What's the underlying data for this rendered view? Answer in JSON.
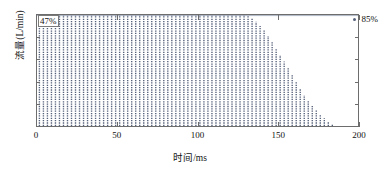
{
  "chart_data": {
    "type": "bar",
    "title": "",
    "xlabel": "时间/ms",
    "ylabel": "流量(L/min)",
    "xlim": [
      0,
      200
    ],
    "ylim": [
      0,
      1.0
    ],
    "xticks": [
      0,
      50,
      100,
      150,
      200
    ],
    "xtick_labels": [
      "0",
      "50",
      "100",
      "150",
      "200"
    ],
    "yticks": [
      0.2,
      0.4,
      0.6,
      0.8,
      1.0
    ],
    "ytick_labels": [
      "0.2",
      "0.4",
      "0.6",
      "0.8",
      "1.0"
    ],
    "grid": false,
    "legend": false,
    "line_color": "#55607a",
    "frame_color": "#6d6d6d",
    "annotations": [
      {
        "name": "duty-cycle-start",
        "text": "47%",
        "position": "top-left",
        "boxed": true
      },
      {
        "name": "duty-cycle-end",
        "text": "85%",
        "position": "top-right",
        "boxed": false,
        "marker": "arrow"
      }
    ],
    "envelope_note": "Upper envelope line drawn at y = 1.0 across the full time axis.",
    "x": [
      1.5,
      4.0,
      6.5,
      9.0,
      11.5,
      14.0,
      16.5,
      19.0,
      21.5,
      24.0,
      26.5,
      29.0,
      31.5,
      34.0,
      36.5,
      39.0,
      41.5,
      44.0,
      46.5,
      49.0,
      51.5,
      54.0,
      56.5,
      59.0,
      61.5,
      64.0,
      66.5,
      69.0,
      71.5,
      74.0,
      76.5,
      79.0,
      81.5,
      84.0,
      86.5,
      89.0,
      91.5,
      94.0,
      96.5,
      99.0,
      101.5,
      104.0,
      106.5,
      109.0,
      111.5,
      114.0,
      116.5,
      119.0,
      121.5,
      124.0,
      126.5,
      129.0,
      131.5,
      134.0,
      136.5,
      139.0,
      141.5,
      144.0,
      146.5,
      149.0,
      151.5,
      154.0,
      156.5,
      159.0,
      161.5,
      164.0,
      166.5,
      169.0,
      171.5,
      174.0,
      176.5,
      179.0,
      181.5,
      184.0
    ],
    "values": [
      1.0,
      1.0,
      1.0,
      1.0,
      1.0,
      1.0,
      1.0,
      1.0,
      1.0,
      1.0,
      1.0,
      1.0,
      1.0,
      1.0,
      1.0,
      1.0,
      1.0,
      1.0,
      1.0,
      1.0,
      1.0,
      1.0,
      1.0,
      1.0,
      1.0,
      1.0,
      1.0,
      1.0,
      1.0,
      1.0,
      1.0,
      1.0,
      1.0,
      1.0,
      1.0,
      1.0,
      1.0,
      1.0,
      1.0,
      1.0,
      1.0,
      1.0,
      1.0,
      1.0,
      1.0,
      1.0,
      1.0,
      1.0,
      1.0,
      1.0,
      1.0,
      1.0,
      0.99,
      0.97,
      0.94,
      0.9,
      0.86,
      0.81,
      0.76,
      0.7,
      0.64,
      0.58,
      0.52,
      0.46,
      0.4,
      0.34,
      0.28,
      0.23,
      0.18,
      0.14,
      0.1,
      0.07,
      0.04,
      0.02
    ]
  },
  "axes": {
    "ylabel": "流量(L/min)",
    "xlabel": "时间/ms"
  }
}
